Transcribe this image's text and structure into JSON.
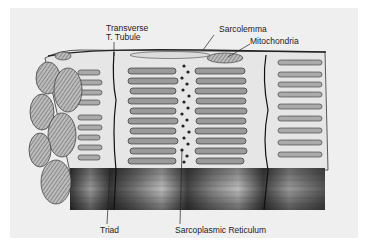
{
  "figure": {
    "labels": {
      "transverse_line1": "Transverse",
      "transverse_line2": "T. Tubule",
      "sarcolemma": "Sarcolemma",
      "mitochondria": "Mitochondria",
      "triad": "Triad",
      "sarcoplasmic_reticulum": "Sarcoplasmic Reticulum"
    },
    "colors": {
      "background": "#efefef",
      "ink": "#222222",
      "fiber_dark": "#4a4a4a",
      "fiber_light": "#cfcfcf"
    }
  }
}
